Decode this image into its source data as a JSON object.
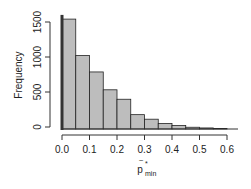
{
  "chart_data": {
    "type": "bar",
    "title": "",
    "xlabel": "p̃*min",
    "ylabel": "Frequency",
    "bin_width": 0.05,
    "categories": [
      "0.00-0.05",
      "0.05-0.10",
      "0.10-0.15",
      "0.15-0.20",
      "0.20-0.25",
      "0.25-0.30",
      "0.30-0.35",
      "0.35-0.40",
      "0.40-0.45",
      "0.45-0.50",
      "0.50-0.55",
      "0.55-0.60"
    ],
    "bin_starts": [
      0.0,
      0.05,
      0.1,
      0.15,
      0.2,
      0.25,
      0.3,
      0.35,
      0.4,
      0.45,
      0.5,
      0.55
    ],
    "values": [
      1570,
      1050,
      815,
      560,
      425,
      205,
      140,
      80,
      50,
      25,
      15,
      8
    ],
    "spike_at_zero": 1630,
    "xticks": [
      "0.0",
      "0.1",
      "0.2",
      "0.3",
      "0.4",
      "0.5",
      "0.6"
    ],
    "yticks": [
      "0",
      "500",
      "1000",
      "1500"
    ],
    "xlim": [
      0,
      0.65
    ],
    "ylim": [
      0,
      1600
    ],
    "grid": false,
    "bar_color": "#bdbdbd",
    "bar_edge": "#222222"
  },
  "axis": {
    "xlabel_main": "p",
    "xlabel_sub": "min",
    "xlabel_sup": "*",
    "ylabel": "Frequency"
  }
}
